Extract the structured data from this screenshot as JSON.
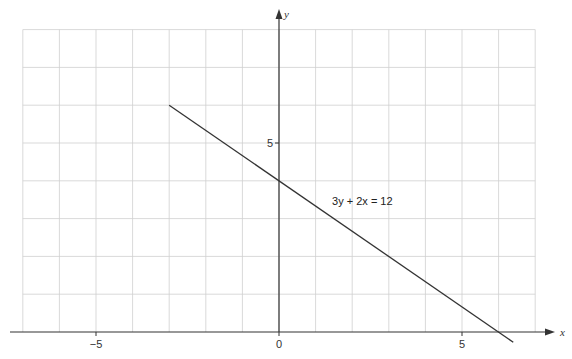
{
  "chart_data": {
    "type": "line",
    "title": "",
    "xlabel": "x",
    "ylabel": "y",
    "xlim": [
      -7,
      7
    ],
    "ylim": [
      0,
      8
    ],
    "grid": true,
    "grid_step": 1,
    "x_ticks": [
      {
        "value": -5,
        "label": "−5"
      },
      {
        "value": 0,
        "label": "0"
      },
      {
        "value": 5,
        "label": "5"
      }
    ],
    "y_ticks": [
      {
        "value": 5,
        "label": "5"
      }
    ],
    "series": [
      {
        "name": "3y + 2x = 12",
        "equation": "3y + 2x = 12",
        "x": [
          -3,
          6.4
        ],
        "y": [
          6,
          -0.27
        ],
        "color": "#333333"
      }
    ],
    "annotations": [
      {
        "text": "3y + 2x = 12",
        "x": 1.45,
        "y": 3.3
      }
    ],
    "legend": "none"
  },
  "colors": {
    "grid": "#cfcfcf",
    "axis": "#333333",
    "line": "#333333"
  }
}
